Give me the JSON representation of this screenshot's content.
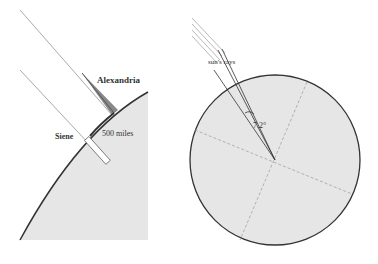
{
  "left_diagram": {
    "labels": {
      "alexandria": "Alexandria",
      "siene": "Siene",
      "distance": "500 miles"
    }
  },
  "right_diagram": {
    "labels": {
      "rays": "sun's rays",
      "angle": "7.2°"
    }
  },
  "colors": {
    "earth_fill": "#e6e6e6",
    "outline": "#333333",
    "ray": "#999999",
    "shadow": "#888888"
  }
}
